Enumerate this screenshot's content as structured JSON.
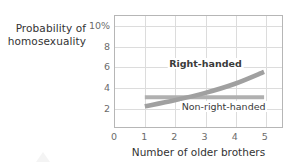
{
  "chart_data": {
    "type": "line",
    "title": "",
    "ylabel": "Probability of homosexuality",
    "xlabel": "Number of older brothers",
    "x": [
      1,
      2,
      3,
      4,
      5
    ],
    "xticks": [
      "0",
      "1",
      "2",
      "3",
      "4",
      "5"
    ],
    "xtick_values": [
      0,
      1,
      2,
      3,
      4,
      5
    ],
    "yticks": [
      "2",
      "4",
      "6",
      "8",
      "10%"
    ],
    "ytick_values": [
      2,
      4,
      6,
      8,
      10
    ],
    "ylim": [
      0,
      11
    ],
    "xlim": [
      0,
      5.6
    ],
    "grid": true,
    "legend_position": "inline-annotations",
    "series": [
      {
        "name": "Right-handed",
        "values": [
          2.1,
          2.7,
          3.4,
          4.3,
          5.5
        ],
        "color": "#a0a0a0"
      },
      {
        "name": "Non-right-handed",
        "values": [
          3.0,
          3.0,
          3.0,
          3.0,
          3.0
        ],
        "color": "#b0b0b0"
      }
    ],
    "annotations": [
      {
        "text": "Right-handed",
        "x": 3.0,
        "y": 6.3
      },
      {
        "text": "Non-right-handed",
        "x": 3.6,
        "y": 2.1
      }
    ]
  },
  "axes": {
    "y_title_line1": "Probability of",
    "y_title_line2": "homosexuality",
    "x_title": "Number of older brothers",
    "y_tick_labels": [
      "10%",
      "8",
      "6",
      "4",
      "2"
    ],
    "x_tick_labels": [
      "0",
      "1",
      "2",
      "3",
      "4",
      "5"
    ]
  },
  "labels": {
    "right_handed": "Right-handed",
    "non_right_handed": "Non-right-handed"
  },
  "colors": {
    "frame": "#b6b6b6",
    "grid": "#dcdcdc",
    "tick_text": "#6b6b6b",
    "title_text": "#333333",
    "series_right_handed": "#a0a0a0",
    "series_non_right_handed": "#b0b0b0",
    "background": "#ffffff"
  }
}
